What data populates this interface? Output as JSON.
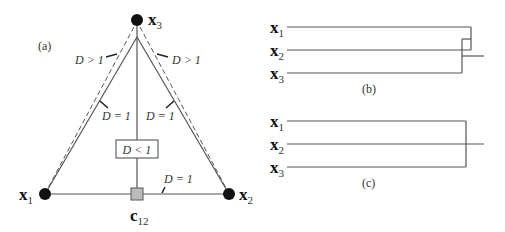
{
  "panel_a": {
    "label": "(a)",
    "points": {
      "x1": {
        "name": "x",
        "sub": "1"
      },
      "x2": {
        "name": "x",
        "sub": "2"
      },
      "x3": {
        "name": "x",
        "sub": "3"
      },
      "c12": {
        "name": "c",
        "sub": "12"
      }
    },
    "edge_labels": {
      "left_outer": "D > 1",
      "right_outer": "D > 1",
      "left_inner": "D = 1",
      "right_inner": "D = 1",
      "center_box": "D < 1",
      "base": "D = 1"
    }
  },
  "panel_b": {
    "label": "(b)",
    "leaves": [
      {
        "name": "x",
        "sub": "1"
      },
      {
        "name": "x",
        "sub": "2"
      },
      {
        "name": "x",
        "sub": "3"
      }
    ]
  },
  "panel_c": {
    "label": "(c)",
    "leaves": [
      {
        "name": "x",
        "sub": "1"
      },
      {
        "name": "x",
        "sub": "2"
      },
      {
        "name": "x",
        "sub": "3"
      }
    ]
  }
}
